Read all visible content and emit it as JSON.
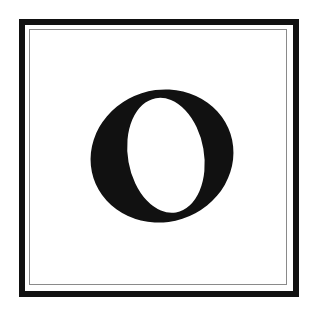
{
  "tile": {
    "letter": "O",
    "style": "italic serif",
    "colors": {
      "background": "#ffffff",
      "outer_border": "#111111",
      "inner_border": "#8a8a8a",
      "letter": "#111111"
    }
  }
}
